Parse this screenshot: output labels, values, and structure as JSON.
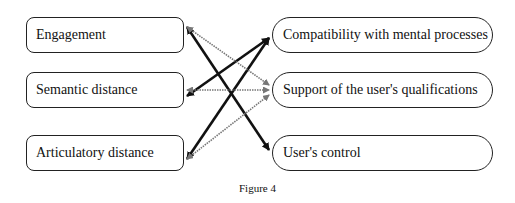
{
  "left_nodes": [
    {
      "id": "engagement",
      "label": "Engagement"
    },
    {
      "id": "semantic",
      "label": "Semantic distance"
    },
    {
      "id": "articulatory",
      "label": "Articulatory distance"
    }
  ],
  "right_nodes": [
    {
      "id": "compatibility",
      "label": "Compatibility with mental processes"
    },
    {
      "id": "support",
      "label": "Support of the user's qualifications"
    },
    {
      "id": "control",
      "label": "User's control"
    }
  ],
  "edges": [
    {
      "from": "engagement",
      "to": "control",
      "style": "bold",
      "direction": "both"
    },
    {
      "from": "semantic",
      "to": "compatibility",
      "style": "bold",
      "direction": "both"
    },
    {
      "from": "articulatory",
      "to": "compatibility",
      "style": "bold",
      "direction": "both"
    },
    {
      "from": "engagement",
      "to": "support",
      "style": "dotted",
      "direction": "both"
    },
    {
      "from": "semantic",
      "to": "support",
      "style": "dotted",
      "direction": "both"
    },
    {
      "from": "articulatory",
      "to": "support",
      "style": "dotted",
      "direction": "both"
    }
  ],
  "caption": "Figure 4"
}
